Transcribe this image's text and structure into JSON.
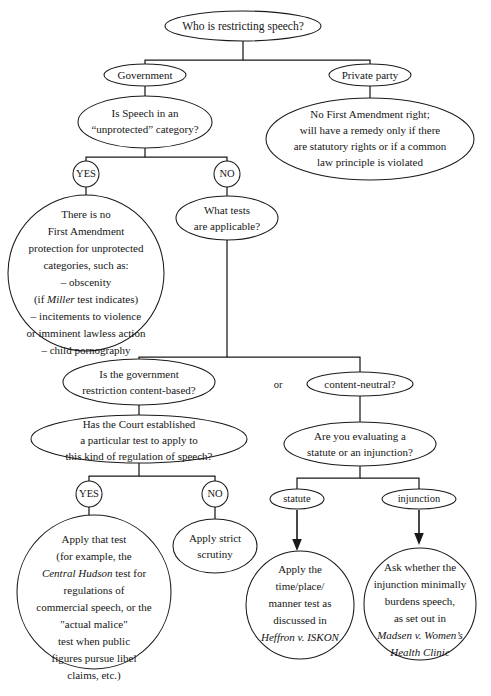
{
  "diagram": {
    "stroke_color": "#1a1a1a",
    "text_color": "#161616",
    "background_color": "#ffffff",
    "connector_label": "or"
  },
  "nodes": {
    "root_question": {
      "id": "root",
      "shape": "ellipse",
      "lines": [
        "Who is restricting speech?"
      ]
    },
    "government": {
      "id": "government",
      "shape": "ellipse",
      "lines": [
        "Government"
      ]
    },
    "private_party": {
      "id": "private_party",
      "shape": "ellipse",
      "lines": [
        "Private party"
      ]
    },
    "unprotected_question": {
      "id": "unprotected_question",
      "shape": "ellipse",
      "lines": [
        "Is Speech in an",
        "“unprotected” category?"
      ]
    },
    "private_outcome": {
      "id": "private_outcome",
      "shape": "ellipse",
      "lines": [
        "No First Amendment right;",
        "will have a remedy only if there",
        "are statutory rights or if a common",
        "law principle is violated"
      ]
    },
    "yes_1": {
      "id": "yes_1",
      "shape": "circle",
      "lines": [
        "YES"
      ]
    },
    "no_1": {
      "id": "no_1",
      "shape": "circle",
      "lines": [
        "NO"
      ]
    },
    "no_protection": {
      "id": "no_protection",
      "shape": "circle",
      "lines": [
        "There is no",
        "First Amendment",
        "protection for unprotected",
        "categories, such as:",
        "– obscenity",
        "(if Miller test indicates)",
        "– incitements to violence",
        "or imminent lawless action",
        "– child pornography"
      ],
      "italic_lines": {
        "5": {
          "word": "Miller"
        }
      }
    },
    "what_tests": {
      "id": "what_tests",
      "shape": "ellipse",
      "lines": [
        "What tests",
        "are applicable?"
      ]
    },
    "content_based": {
      "id": "content_based",
      "shape": "ellipse",
      "lines": [
        "Is the government",
        "restriction content-based?"
      ]
    },
    "content_neutral": {
      "id": "content_neutral",
      "shape": "ellipse",
      "lines": [
        "content-neutral?"
      ]
    },
    "court_established": {
      "id": "court_established",
      "shape": "ellipse",
      "lines": [
        "Has the Court established",
        "a particular test to apply to",
        "this kind of regulation of speech?"
      ]
    },
    "evaluating": {
      "id": "evaluating",
      "shape": "ellipse",
      "lines": [
        "Are you evaluating a",
        "statute or an injunction?"
      ]
    },
    "yes_2": {
      "id": "yes_2",
      "shape": "circle",
      "lines": [
        "YES"
      ]
    },
    "no_2": {
      "id": "no_2",
      "shape": "circle",
      "lines": [
        "NO"
      ]
    },
    "statute": {
      "id": "statute",
      "shape": "ellipse",
      "lines": [
        "statute"
      ]
    },
    "injunction": {
      "id": "injunction",
      "shape": "ellipse",
      "lines": [
        "injunction"
      ]
    },
    "apply_that_test": {
      "id": "apply_that_test",
      "shape": "circle",
      "lines": [
        "Apply that test",
        "(for example, the",
        "Central Hudson test for",
        "regulations of",
        "commercial speech, or the",
        "\"actual malice\"",
        "test when public",
        "figures pursue libel",
        "claims, etc.)"
      ],
      "italic_lines": {
        "2": {
          "word": "Central Hudson"
        }
      }
    },
    "strict_scrutiny": {
      "id": "strict_scrutiny",
      "shape": "ellipse",
      "lines": [
        "Apply strict",
        "scrutiny"
      ]
    },
    "time_place_manner": {
      "id": "time_place_manner",
      "shape": "circle",
      "lines": [
        "Apply the",
        "time/place/",
        "manner test as",
        "discussed in",
        "Heffron v. ISKON"
      ],
      "italic_lines": {
        "4": {
          "word": "Heffron v. ISKON"
        }
      }
    },
    "madsen": {
      "id": "madsen",
      "shape": "circle",
      "lines": [
        "Ask whether the",
        "injunction minimally",
        "burdens speech,",
        "as set out in",
        "Madsen v. Women’s",
        "Health Clinic"
      ],
      "italic_lines": {
        "4": {
          "word": "Madsen v. Women’s"
        },
        "5": {
          "word": "Health Clinic"
        }
      }
    }
  }
}
